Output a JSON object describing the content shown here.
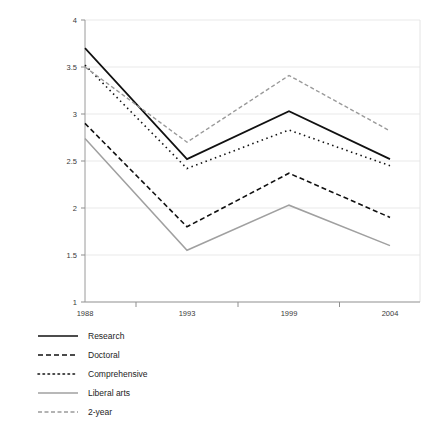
{
  "chart_data": {
    "type": "line",
    "title": "",
    "subtitle": "",
    "xlabel": "",
    "ylabel": "",
    "x": [
      "1988",
      "1993",
      "1999",
      "2004"
    ],
    "categories": [
      "1988",
      "1993",
      "1999",
      "2004"
    ],
    "xtick_labels": [
      "1988",
      "1993",
      "1999",
      "2004"
    ],
    "ytick_labels": [
      "1",
      "1.5",
      "2",
      "2.5",
      "3",
      "3.5",
      "4"
    ],
    "ytick_values": [
      1,
      1.5,
      2,
      2.5,
      3,
      3.5,
      4
    ],
    "ylim": [
      1,
      4
    ],
    "grid": "horizontal",
    "legend_position": "below-left",
    "series": [
      {
        "name": "Research",
        "values": [
          3.7,
          2.52,
          3.03,
          2.52
        ],
        "color": "#111111",
        "style": "solid",
        "width": 1.7,
        "dash": "none"
      },
      {
        "name": "Doctoral",
        "values": [
          2.9,
          1.8,
          2.37,
          1.9
        ],
        "color": "#111111",
        "style": "dashed",
        "width": 1.6,
        "dash": "5,3"
      },
      {
        "name": "Comprehensive",
        "values": [
          3.52,
          2.42,
          2.83,
          2.45
        ],
        "color": "#111111",
        "style": "dotted",
        "width": 1.6,
        "dash": "1.5,3.5"
      },
      {
        "name": "Liberal arts",
        "values": [
          2.74,
          1.55,
          2.03,
          1.6
        ],
        "color": "#a0a0a0",
        "style": "solid",
        "width": 1.5,
        "dash": "none"
      },
      {
        "name": "2-year",
        "values": [
          3.5,
          2.7,
          3.41,
          2.82
        ],
        "color": "#9a9a9a",
        "style": "dashed",
        "width": 1.4,
        "dash": "4,2.5"
      }
    ]
  },
  "legend": {
    "entries": [
      {
        "label": "Research"
      },
      {
        "label": "Doctoral"
      },
      {
        "label": "Comprehensive"
      },
      {
        "label": "Liberal arts"
      },
      {
        "label": "2-year"
      }
    ]
  },
  "colors": {
    "grid": "#e9e9e9",
    "axis": "#9a9a9a",
    "frame": "#e4e4e4",
    "text": "#2b2b2b",
    "black_series": "#111111",
    "gray_series": "#a0a0a0",
    "background": "#ffffff"
  },
  "geometry": {
    "plot_left": 85,
    "plot_right": 420,
    "plot_top": 20,
    "plot_bottom": 302,
    "x_positions": [
      85,
      187,
      289,
      390
    ]
  }
}
